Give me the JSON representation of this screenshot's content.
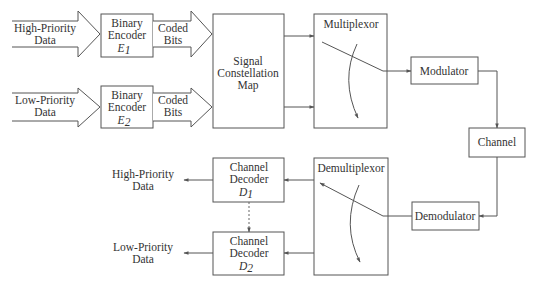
{
  "inputs": {
    "high_priority": {
      "line1": "High-Priority",
      "line2": "Data"
    },
    "low_priority": {
      "line1": "Low-Priority",
      "line2": "Data"
    }
  },
  "encoders": [
    {
      "line1": "Binary",
      "line2": "Encoder",
      "symbol": "E",
      "subscript": "1"
    },
    {
      "line1": "Binary",
      "line2": "Encoder",
      "symbol": "E",
      "subscript": "2"
    }
  ],
  "coded_bits": [
    {
      "line1": "Coded",
      "line2": "Bits"
    },
    {
      "line1": "Coded",
      "line2": "Bits"
    }
  ],
  "signal_map": {
    "line1": "Signal",
    "line2": "Constellation",
    "line3": "Map"
  },
  "multiplexor": {
    "label": "Multiplexor"
  },
  "modulator": {
    "label": "Modulator"
  },
  "channel": {
    "label": "Channel"
  },
  "demodulator": {
    "label": "Demodulator"
  },
  "demultiplexor": {
    "label": "Demultiplexor"
  },
  "decoders": [
    {
      "line1": "Channel",
      "line2": "Decoder",
      "symbol": "D",
      "subscript": "1"
    },
    {
      "line1": "Channel",
      "line2": "Decoder",
      "symbol": "D",
      "subscript": "2"
    }
  ],
  "outputs": {
    "high_priority": {
      "line1": "High-Priority",
      "line2": "Data"
    },
    "low_priority": {
      "line1": "Low-Priority",
      "line2": "Data"
    }
  },
  "colors": {
    "stroke": "#555555",
    "text": "#333333",
    "background": "#ffffff"
  }
}
